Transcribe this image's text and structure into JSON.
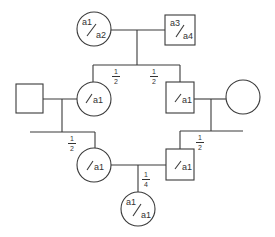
{
  "diagram": {
    "type": "pedigree",
    "line_color": "#3a3a3a",
    "individuals": [
      {
        "id": "gen1-female",
        "shape": "circle",
        "genotype_top": "a1",
        "genotype_bottom": "a2"
      },
      {
        "id": "gen1-male",
        "shape": "square",
        "genotype_top": "a3",
        "genotype_bottom": "a4"
      },
      {
        "id": "gen2-spouse-left",
        "shape": "square",
        "genotype_top": "",
        "genotype_bottom": ""
      },
      {
        "id": "gen2-daughter",
        "shape": "circle",
        "genotype_top": "",
        "genotype_bottom": "a1"
      },
      {
        "id": "gen2-son",
        "shape": "square",
        "genotype_top": "",
        "genotype_bottom": "a1"
      },
      {
        "id": "gen2-spouse-right",
        "shape": "circle",
        "genotype_top": "",
        "genotype_bottom": ""
      },
      {
        "id": "gen3-female",
        "shape": "circle",
        "genotype_top": "",
        "genotype_bottom": "a1"
      },
      {
        "id": "gen3-male",
        "shape": "square",
        "genotype_top": "",
        "genotype_bottom": "a1"
      },
      {
        "id": "gen4-offspring",
        "shape": "circle",
        "genotype_top": "a1",
        "genotype_bottom": "a1"
      }
    ],
    "probabilities": {
      "gen1_to_daughter": {
        "num": "1",
        "den": "2"
      },
      "gen1_to_son": {
        "num": "1",
        "den": "2"
      },
      "daughter_to_child": {
        "num": "1",
        "den": "2"
      },
      "son_to_child": {
        "num": "1",
        "den": "2"
      },
      "cousins_to_offspring": {
        "num": "1",
        "den": "4"
      }
    },
    "labels": {
      "g1f_top": "a1",
      "g1f_bot": "a2",
      "g1m_top": "a3",
      "g1m_bot": "a4",
      "g2d": "a1",
      "g2s": "a1",
      "g3f": "a1",
      "g3m": "a1",
      "g4_top": "a1",
      "g4_bot": "a1"
    }
  }
}
